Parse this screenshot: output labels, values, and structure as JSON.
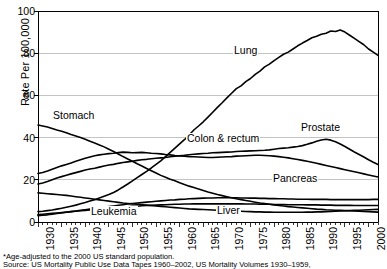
{
  "chart_data": {
    "type": "line",
    "title": "",
    "subtitle": "",
    "xlabel": "",
    "ylabel": "Rate Per 100,000",
    "xlim": [
      1930,
      2002
    ],
    "ylim": [
      0,
      100
    ],
    "grid": true,
    "legend_position": "inline-labels",
    "yticks": [
      100,
      80,
      60,
      40,
      20,
      0
    ],
    "xticks": [
      1930,
      1935,
      1940,
      1945,
      1950,
      1955,
      1960,
      1965,
      1970,
      1975,
      1980,
      1985,
      1990,
      1995,
      2000
    ],
    "x": [
      1930,
      1931,
      1932,
      1933,
      1934,
      1935,
      1936,
      1937,
      1938,
      1939,
      1940,
      1941,
      1942,
      1943,
      1944,
      1945,
      1946,
      1947,
      1948,
      1949,
      1950,
      1951,
      1952,
      1953,
      1954,
      1955,
      1956,
      1957,
      1958,
      1959,
      1960,
      1961,
      1962,
      1963,
      1964,
      1965,
      1966,
      1967,
      1968,
      1969,
      1970,
      1971,
      1972,
      1973,
      1974,
      1975,
      1976,
      1977,
      1978,
      1979,
      1980,
      1981,
      1982,
      1983,
      1984,
      1985,
      1986,
      1987,
      1988,
      1989,
      1990,
      1991,
      1992,
      1993,
      1994,
      1995,
      1996,
      1997,
      1998,
      1999,
      2000,
      2001,
      2002
    ],
    "series": [
      {
        "name": "Lung",
        "label": "Lung",
        "label_x": 233,
        "label_y": 45,
        "values": [
          4.9,
          5.1,
          5.4,
          5.7,
          6.1,
          6.5,
          7.0,
          7.5,
          8.0,
          8.6,
          9.2,
          9.9,
          10.6,
          11.4,
          12.2,
          13.0,
          14.0,
          15.2,
          16.6,
          18.0,
          19.5,
          21.0,
          22.5,
          24.0,
          25.6,
          27.3,
          29.0,
          31.0,
          33.0,
          35.0,
          37.0,
          39.0,
          41.2,
          43.6,
          45.5,
          47.5,
          49.7,
          52.0,
          54.3,
          56.5,
          58.8,
          61.0,
          63.2,
          64.5,
          66.5,
          68.0,
          70.0,
          71.5,
          73.5,
          74.8,
          76.5,
          78.0,
          79.5,
          80.5,
          82.0,
          83.5,
          84.8,
          86.0,
          87.3,
          88.0,
          89.0,
          89.5,
          90.5,
          90.3,
          91.0,
          90.0,
          88.5,
          87.0,
          85.5,
          84.0,
          82.0,
          80.5,
          79.0
        ]
      },
      {
        "name": "Stomach",
        "label": "Stomach",
        "label_x": 52,
        "label_y": 110,
        "values": [
          46.0,
          45.5,
          45.0,
          44.3,
          43.6,
          43.0,
          42.3,
          41.5,
          40.8,
          40.0,
          39.2,
          38.3,
          37.4,
          36.5,
          35.6,
          34.5,
          33.4,
          32.2,
          31.0,
          29.9,
          28.8,
          27.6,
          26.5,
          25.4,
          24.3,
          23.2,
          22.1,
          21.2,
          20.3,
          19.5,
          18.6,
          17.8,
          17.0,
          16.3,
          15.6,
          14.9,
          14.2,
          13.6,
          13.0,
          12.5,
          12.0,
          11.5,
          11.0,
          10.6,
          10.2,
          9.8,
          9.4,
          9.0,
          8.7,
          8.4,
          8.1,
          7.8,
          7.6,
          7.3,
          7.1,
          6.9,
          6.7,
          6.5,
          6.3,
          6.1,
          6.0,
          5.8,
          5.7,
          5.6,
          5.5,
          5.4,
          5.3,
          5.2,
          5.1,
          5.0,
          4.9,
          4.8,
          4.7
        ]
      },
      {
        "name": "Colon & rectum",
        "label": "Colon & rectum",
        "label_x": 186,
        "label_y": 133,
        "values": [
          23.0,
          23.5,
          24.2,
          25.0,
          25.8,
          26.6,
          27.3,
          28.0,
          28.8,
          29.5,
          30.2,
          30.8,
          31.4,
          31.8,
          32.1,
          32.4,
          32.6,
          32.9,
          33.1,
          33.0,
          32.8,
          32.9,
          33.0,
          32.8,
          32.6,
          32.5,
          32.3,
          32.0,
          31.8,
          31.5,
          31.3,
          31.2,
          31.0,
          30.9,
          30.8,
          30.7,
          30.6,
          30.6,
          30.7,
          30.8,
          30.9,
          31.0,
          31.2,
          31.3,
          31.4,
          31.5,
          31.6,
          31.6,
          31.5,
          31.4,
          31.2,
          31.0,
          30.7,
          30.4,
          30.0,
          29.6,
          29.2,
          28.8,
          28.3,
          27.8,
          27.3,
          26.8,
          26.3,
          25.8,
          25.3,
          24.8,
          24.3,
          23.8,
          23.3,
          22.8,
          22.3,
          21.8,
          21.3
        ]
      },
      {
        "name": "Prostate",
        "label": "Prostate",
        "label_x": 300,
        "label_y": 122,
        "values": [
          18.0,
          18.5,
          19.2,
          20.0,
          20.8,
          21.5,
          22.2,
          22.8,
          23.4,
          24.0,
          24.6,
          25.1,
          25.5,
          26.0,
          26.5,
          27.0,
          27.3,
          27.8,
          28.2,
          28.5,
          28.8,
          29.2,
          29.5,
          29.7,
          30.0,
          30.2,
          30.4,
          30.6,
          30.9,
          31.2,
          31.4,
          31.6,
          31.9,
          32.1,
          32.3,
          32.5,
          32.6,
          32.8,
          32.9,
          33.0,
          33.1,
          33.2,
          33.4,
          33.5,
          33.6,
          33.7,
          33.8,
          33.9,
          34.0,
          34.2,
          34.5,
          34.8,
          35.0,
          35.2,
          35.5,
          35.8,
          36.2,
          36.8,
          37.5,
          38.3,
          38.9,
          39.2,
          38.8,
          38.0,
          37.0,
          35.8,
          34.5,
          33.2,
          32.0,
          30.8,
          29.5,
          28.3,
          27.3
        ]
      },
      {
        "name": "Pancreas",
        "label": "Pancreas",
        "label_x": 272,
        "label_y": 173,
        "values": [
          3.0,
          3.2,
          3.4,
          3.7,
          4.0,
          4.3,
          4.6,
          4.9,
          5.2,
          5.5,
          5.8,
          6.1,
          6.4,
          6.7,
          7.0,
          7.3,
          7.6,
          7.9,
          8.2,
          8.5,
          8.8,
          9.0,
          9.2,
          9.4,
          9.6,
          9.8,
          10.0,
          10.2,
          10.4,
          10.5,
          10.7,
          10.8,
          11.0,
          11.1,
          11.2,
          11.3,
          11.4,
          11.4,
          11.5,
          11.5,
          11.5,
          11.5,
          11.5,
          11.4,
          11.4,
          11.3,
          11.3,
          11.2,
          11.2,
          11.1,
          11.1,
          11.0,
          11.0,
          10.9,
          10.9,
          10.8,
          10.8,
          10.8,
          10.7,
          10.7,
          10.7,
          10.7,
          10.6,
          10.6,
          10.6,
          10.6,
          10.6,
          10.6,
          10.6,
          10.6,
          10.6,
          10.7,
          10.7
        ]
      },
      {
        "name": "Leukemia",
        "label": "Leukemia",
        "label_x": 90,
        "label_y": 206,
        "values": [
          3.5,
          3.7,
          3.9,
          4.1,
          4.3,
          4.5,
          4.7,
          4.9,
          5.1,
          5.3,
          5.5,
          5.7,
          5.9,
          6.1,
          6.3,
          6.5,
          6.7,
          6.9,
          7.0,
          7.2,
          7.4,
          7.5,
          7.7,
          7.8,
          7.9,
          8.0,
          8.1,
          8.2,
          8.3,
          8.4,
          8.4,
          8.5,
          8.5,
          8.6,
          8.6,
          8.6,
          8.6,
          8.6,
          8.6,
          8.6,
          8.6,
          8.6,
          8.6,
          8.6,
          8.5,
          8.5,
          8.5,
          8.4,
          8.4,
          8.4,
          8.3,
          8.3,
          8.3,
          8.2,
          8.2,
          8.2,
          8.2,
          8.1,
          8.1,
          8.1,
          8.0,
          8.0,
          8.0,
          7.9,
          7.9,
          7.9,
          7.9,
          7.8,
          7.8,
          7.8,
          7.8,
          7.8,
          7.8
        ]
      },
      {
        "name": "Liver",
        "label": "Liver",
        "label_x": 216,
        "label_y": 205,
        "values": [
          13.8,
          13.6,
          13.4,
          13.2,
          13.0,
          12.8,
          12.6,
          12.3,
          12.0,
          11.7,
          11.4,
          11.1,
          10.8,
          10.5,
          10.2,
          9.9,
          9.6,
          9.3,
          9.0,
          8.8,
          8.6,
          8.4,
          8.2,
          8.0,
          7.8,
          7.6,
          7.4,
          7.2,
          7.0,
          6.8,
          6.6,
          6.4,
          6.2,
          6.1,
          6.0,
          5.9,
          5.8,
          5.7,
          5.6,
          5.5,
          5.4,
          5.3,
          5.2,
          5.1,
          5.0,
          4.9,
          4.8,
          4.8,
          4.7,
          4.7,
          4.6,
          4.6,
          4.6,
          4.6,
          4.6,
          4.6,
          4.6,
          4.7,
          4.7,
          4.8,
          4.8,
          4.9,
          5.0,
          5.1,
          5.2,
          5.3,
          5.4,
          5.5,
          5.6,
          5.7,
          5.8,
          5.9,
          6.0
        ]
      }
    ]
  },
  "footnotes": {
    "line1": "*Age-adjusted to the 2000 US standard population.",
    "line2": "Source: US Mortality Public Use Data Tapes 1960–2002, US Mortality Volumes 1930–1959,"
  }
}
